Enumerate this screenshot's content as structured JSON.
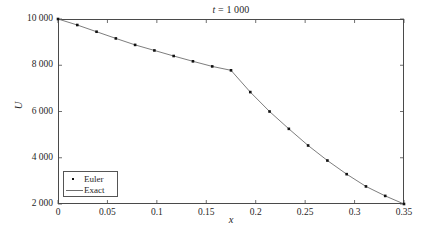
{
  "chart_data": {
    "type": "line",
    "title": "t = 1 000",
    "title_var": "t",
    "title_value": "1 000",
    "xlabel": "x",
    "ylabel": "U",
    "xlim": [
      0,
      0.35
    ],
    "ylim": [
      2000,
      10000
    ],
    "xticks": [
      0,
      0.05,
      0.1,
      0.15,
      0.2,
      0.25,
      0.3,
      0.35
    ],
    "xtick_labels": [
      "0",
      "0.05",
      "0.1",
      "0.15",
      "0.2",
      "0.25",
      "0.3",
      "0.35"
    ],
    "yticks": [
      2000,
      4000,
      6000,
      8000,
      10000
    ],
    "ytick_labels": [
      "2 000",
      "4 000",
      "6 000",
      "8 000",
      "10 000"
    ],
    "grid": false,
    "legend_position": "lower left",
    "series": [
      {
        "name": "Euler",
        "style": "markers",
        "marker": "dot",
        "color": "#111111",
        "x": [
          0.0,
          0.0195,
          0.039,
          0.0585,
          0.078,
          0.0975,
          0.117,
          0.1365,
          0.156,
          0.175,
          0.1945,
          0.214,
          0.2335,
          0.253,
          0.2725,
          0.292,
          0.3115,
          0.331,
          0.35
        ],
        "y": [
          10000,
          9740,
          9450,
          9160,
          8880,
          8640,
          8400,
          8170,
          7950,
          7780,
          6840,
          6000,
          5250,
          4530,
          3880,
          3290,
          2760,
          2350,
          2000
        ]
      },
      {
        "name": "Exact",
        "style": "line",
        "color": "#6e6e6e",
        "x": [
          0.0,
          0.0195,
          0.039,
          0.0585,
          0.078,
          0.0975,
          0.117,
          0.1365,
          0.156,
          0.175,
          0.1945,
          0.214,
          0.2335,
          0.253,
          0.2725,
          0.292,
          0.3115,
          0.331,
          0.35
        ],
        "y": [
          10000,
          9740,
          9450,
          9160,
          8880,
          8640,
          8400,
          8170,
          7950,
          7780,
          6840,
          6000,
          5250,
          4530,
          3880,
          3290,
          2760,
          2350,
          2000
        ]
      }
    ]
  },
  "legend": {
    "items": [
      {
        "label": "Euler"
      },
      {
        "label": "Exact"
      }
    ]
  }
}
